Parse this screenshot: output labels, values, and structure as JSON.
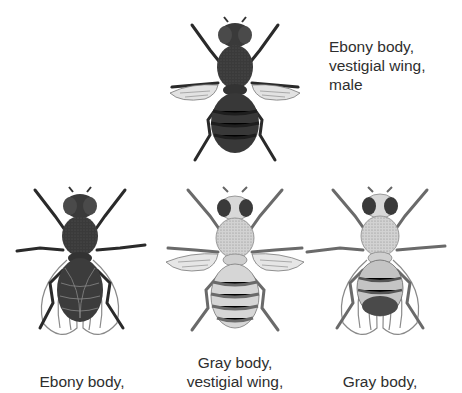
{
  "figure": {
    "flies": [
      {
        "id": "top",
        "label_lines": [
          "Ebony body,",
          "vestigial wing,",
          "male"
        ],
        "body": "ebony",
        "wing": "vestigial",
        "colors": {
          "body": "#3a3a3a",
          "stripe": "#1e1e1e",
          "wing": "#cfcfcf"
        }
      },
      {
        "id": "bottom-left",
        "label_lines": [
          "Ebony body,"
        ],
        "body": "ebony",
        "wing": "normal",
        "colors": {
          "body": "#3c3c3c",
          "stripe": "#222222",
          "wing": "#9a9a9a"
        }
      },
      {
        "id": "bottom-middle",
        "label_lines": [
          "Gray body,",
          "vestigial wing,"
        ],
        "body": "gray",
        "wing": "vestigial",
        "colors": {
          "body": "#c9c9c9",
          "stripe": "#6a6a6a",
          "wing": "#cfcfcf"
        }
      },
      {
        "id": "bottom-right",
        "label_lines": [
          "Gray body,"
        ],
        "body": "gray",
        "wing": "normal",
        "colors": {
          "body": "#bcbcbc",
          "stripe": "#555555",
          "wing": "#9a9a9a"
        }
      }
    ]
  }
}
